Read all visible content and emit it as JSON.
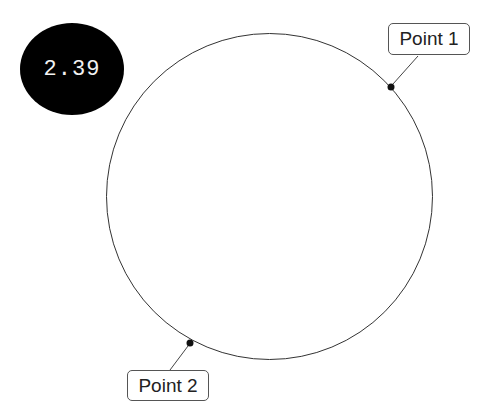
{
  "value_badge": {
    "text": "2.39",
    "background": "#000000",
    "text_color": "#f2f2f2"
  },
  "circle": {
    "cx": 269.5,
    "cy": 196.5,
    "r": 163,
    "stroke": "#333333"
  },
  "points": [
    {
      "label": "Point 1",
      "x": 391,
      "y": 87
    },
    {
      "label": "Point 2",
      "x": 190,
      "y": 343
    }
  ]
}
